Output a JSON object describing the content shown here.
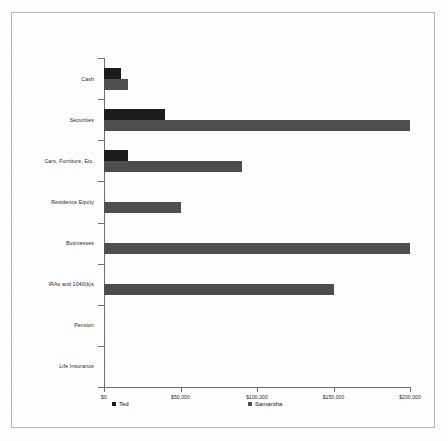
{
  "page": {
    "scan_artifact_text": "· · · · · ·",
    "border_color": "#b9b9b9"
  },
  "legend": {
    "position": "bottom",
    "items": [
      {
        "label": "Ted",
        "color": "#1c1c1c"
      },
      {
        "label": "Samantha",
        "color": "#4e4e4e"
      }
    ]
  },
  "chart_data": {
    "type": "bar",
    "orientation": "horizontal",
    "title": "",
    "subtitle": "",
    "xlabel": "",
    "ylabel": "",
    "grid": false,
    "legend_position": "bottom",
    "xlim": [
      0,
      200000
    ],
    "xticks": [
      0,
      50000,
      100000,
      150000,
      200000
    ],
    "xtick_labels": [
      "$0",
      "$50,000",
      "$100,000",
      "$150,000",
      "$200,000"
    ],
    "categories": [
      "Cash",
      "Securities",
      "Cars, Furniture, Etc.",
      "Residence Equity",
      "Businesses",
      "IRAs and 1040(k)s",
      "Pension",
      "Life Insurance"
    ],
    "series": [
      {
        "name": "Ted",
        "color": "#1c1c1c",
        "values": [
          11000,
          40000,
          16000,
          0,
          0,
          0,
          0,
          0
        ]
      },
      {
        "name": "Samantha",
        "color": "#4e4e4e",
        "values": [
          16000,
          200000,
          90000,
          50000,
          200000,
          150000,
          0,
          0
        ]
      }
    ]
  }
}
